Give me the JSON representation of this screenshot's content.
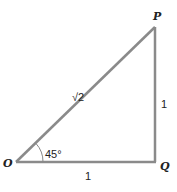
{
  "diagram": {
    "type": "right-triangle",
    "colors": {
      "line": "#8a8a8a",
      "text": "#222222",
      "background": "#ffffff"
    },
    "vertices": [
      {
        "id": "O",
        "label": "O"
      },
      {
        "id": "P",
        "label": "P"
      },
      {
        "id": "Q",
        "label": "Q"
      }
    ],
    "sides": {
      "hypotenuse": {
        "from": "O",
        "to": "P",
        "label": "√2"
      },
      "vertical": {
        "from": "Q",
        "to": "P",
        "label": "1"
      },
      "base": {
        "from": "O",
        "to": "Q",
        "label": "1"
      }
    },
    "angle": {
      "at": "O",
      "label": "45°"
    }
  }
}
